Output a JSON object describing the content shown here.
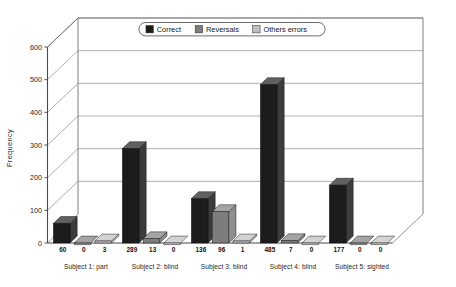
{
  "chart_data": {
    "type": "bar",
    "title": "",
    "subtitle": "",
    "xlabel": "",
    "ylabel": "Frequency",
    "ylim": [
      0,
      600
    ],
    "ytick_values": [
      0,
      100,
      200,
      300,
      400,
      500,
      600
    ],
    "ytick_labels": [
      "0",
      "100",
      "200",
      "300",
      "400",
      "500",
      "600"
    ],
    "grid": true,
    "three_d": true,
    "legend_position": "top-center",
    "categories": [
      "Subject 1: part",
      "Subject 2: blind",
      "Subject 3: blind",
      "Subject 4: blind",
      "Subject 5: sighted"
    ],
    "series": [
      {
        "name": "Correct",
        "color": "#1c1c1c",
        "values": [
          60,
          289,
          136,
          485,
          177
        ]
      },
      {
        "name": "Reversals",
        "color": "#7d7d7d",
        "values": [
          0,
          13,
          96,
          7,
          0
        ]
      },
      {
        "name": "Others errors",
        "color": "#c0c0c0",
        "values": [
          3,
          0,
          1,
          0,
          0
        ]
      }
    ],
    "data_labels": [
      [
        "60",
        "0",
        "3"
      ],
      [
        "289",
        "13",
        "0"
      ],
      [
        "136",
        "96",
        "1"
      ],
      [
        "485",
        "7",
        "0"
      ],
      [
        "177",
        "0",
        "0"
      ]
    ]
  },
  "legend": {
    "items": [
      {
        "label": "Correct",
        "color": "#1c1c1c"
      },
      {
        "label": "Reversals",
        "color": "#7d7d7d"
      },
      {
        "label": "Others errors",
        "color": "#c0c0c0"
      }
    ]
  },
  "axes": {
    "y_title": "Frequency"
  }
}
